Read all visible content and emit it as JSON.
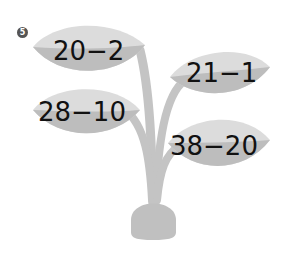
{
  "question": {
    "number": "5"
  },
  "leaves": [
    {
      "expression": "20−2"
    },
    {
      "expression": "21−1"
    },
    {
      "expression": "28−10"
    },
    {
      "expression": "38−20"
    }
  ],
  "colors": {
    "leaf_light": "#dcdcdc",
    "leaf_dark": "#bdbdbd",
    "stem": "#c4c4c4",
    "pot": "#c0c0c0",
    "text": "#111111"
  }
}
